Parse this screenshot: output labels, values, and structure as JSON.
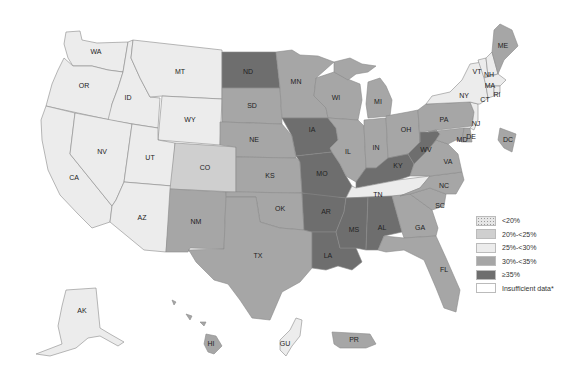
{
  "colors": {
    "lt20": "#e8e8e8",
    "c20_25": "#cfcfcf",
    "c25_30": "#ececec",
    "c30_35": "#a6a6a6",
    "gte35": "#6e6e6e",
    "insufficient": "#ffffff",
    "stroke": "#8a8a8a"
  },
  "legend": {
    "items": [
      {
        "label": "<20%",
        "category": "lt20"
      },
      {
        "label": "20%-<25%",
        "category": "c20_25"
      },
      {
        "label": "25%-<30%",
        "category": "c25_30"
      },
      {
        "label": "30%-<35%",
        "category": "c30_35"
      },
      {
        "label": "≥35%",
        "category": "gte35"
      },
      {
        "label": "Insufficient data*",
        "category": "insufficient"
      }
    ]
  },
  "states": {
    "WA": {
      "label": "WA",
      "category": "c25_30"
    },
    "OR": {
      "label": "OR",
      "category": "c25_30"
    },
    "CA": {
      "label": "CA",
      "category": "c25_30"
    },
    "ID": {
      "label": "ID",
      "category": "c25_30"
    },
    "NV": {
      "label": "NV",
      "category": "c25_30"
    },
    "MT": {
      "label": "MT",
      "category": "c25_30"
    },
    "WY": {
      "label": "WY",
      "category": "c25_30"
    },
    "UT": {
      "label": "UT",
      "category": "c25_30"
    },
    "AZ": {
      "label": "AZ",
      "category": "c25_30"
    },
    "CO": {
      "label": "CO",
      "category": "c20_25"
    },
    "NM": {
      "label": "NM",
      "category": "c30_35"
    },
    "ND": {
      "label": "ND",
      "category": "gte35"
    },
    "SD": {
      "label": "SD",
      "category": "c30_35"
    },
    "NE": {
      "label": "NE",
      "category": "c30_35"
    },
    "KS": {
      "label": "KS",
      "category": "c30_35"
    },
    "OK": {
      "label": "OK",
      "category": "c30_35"
    },
    "TX": {
      "label": "TX",
      "category": "c30_35"
    },
    "MN": {
      "label": "MN",
      "category": "c30_35"
    },
    "IA": {
      "label": "IA",
      "category": "gte35"
    },
    "MO": {
      "label": "MO",
      "category": "gte35"
    },
    "AR": {
      "label": "AR",
      "category": "gte35"
    },
    "LA": {
      "label": "LA",
      "category": "gte35"
    },
    "WI": {
      "label": "WI",
      "category": "c30_35"
    },
    "IL": {
      "label": "IL",
      "category": "c30_35"
    },
    "MI": {
      "label": "MI",
      "category": "c30_35"
    },
    "IN": {
      "label": "IN",
      "category": "c30_35"
    },
    "OH": {
      "label": "OH",
      "category": "c30_35"
    },
    "KY": {
      "label": "KY",
      "category": "gte35"
    },
    "TN": {
      "label": "TN",
      "category": "c25_30"
    },
    "MS": {
      "label": "MS",
      "category": "gte35"
    },
    "AL": {
      "label": "AL",
      "category": "gte35"
    },
    "GA": {
      "label": "GA",
      "category": "c30_35"
    },
    "FL": {
      "label": "FL",
      "category": "c30_35"
    },
    "SC": {
      "label": "SC",
      "category": "c30_35"
    },
    "NC": {
      "label": "NC",
      "category": "c30_35"
    },
    "VA": {
      "label": "VA",
      "category": "c30_35"
    },
    "WV": {
      "label": "WV",
      "category": "gte35"
    },
    "PA": {
      "label": "PA",
      "category": "c30_35"
    },
    "NY": {
      "label": "NY",
      "category": "c25_30"
    },
    "NJ": {
      "label": "NJ",
      "category": "c25_30"
    },
    "MD": {
      "label": "MD",
      "category": "c30_35"
    },
    "DE": {
      "label": "DE",
      "category": "c30_35"
    },
    "DC": {
      "label": "DC",
      "category": "c30_35"
    },
    "VT": {
      "label": "VT",
      "category": "c25_30"
    },
    "NH": {
      "label": "NH",
      "category": "c25_30"
    },
    "MA": {
      "label": "MA",
      "category": "c25_30"
    },
    "CT": {
      "label": "CT",
      "category": "c25_30"
    },
    "RI": {
      "label": "RI",
      "category": "c25_30"
    },
    "ME": {
      "label": "ME",
      "category": "c30_35"
    },
    "AK": {
      "label": "AK",
      "category": "c25_30"
    },
    "HI": {
      "label": "HI",
      "category": "c30_35"
    },
    "GU": {
      "label": "GU",
      "category": "c25_30"
    },
    "PR": {
      "label": "PR",
      "category": "c30_35"
    }
  }
}
